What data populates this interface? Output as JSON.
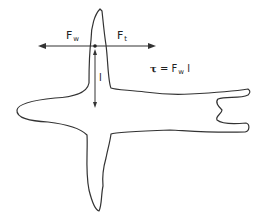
{
  "diagram": {
    "labels": {
      "fw_main": "F",
      "fw_sub": "w",
      "ft_main": "F",
      "ft_sub": "t",
      "lever_arm": "l",
      "torque_symbol": "τ",
      "torque_equals": " = F",
      "torque_sub": "w",
      "torque_tail": " l"
    },
    "colors": {
      "stroke": "#333333",
      "background": "#ffffff"
    }
  }
}
